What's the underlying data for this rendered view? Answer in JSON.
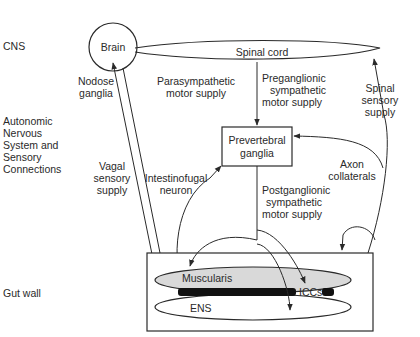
{
  "diagram": {
    "row_labels": {
      "cns": "CNS",
      "autonomic": [
        "Autonomic",
        "Nervous",
        "System and",
        "Sensory",
        "Connections"
      ],
      "gut_wall": "Gut wall"
    },
    "nodes": {
      "brain": "Brain",
      "spinal_cord": "Spinal cord",
      "prevertebral_ganglia": [
        "Prevertebral",
        "ganglia"
      ],
      "muscularis": "Muscularis",
      "ens": "ENS",
      "iccs": "ICCs"
    },
    "pathways": {
      "nodose_ganglia": [
        "Nodose",
        "ganglia"
      ],
      "parasympathetic": [
        "Parasympathetic",
        "motor supply"
      ],
      "preganglionic": [
        "Preganglionic",
        "sympathetic",
        "motor supply"
      ],
      "spinal_sensory": [
        "Spinal",
        "sensory",
        "supply"
      ],
      "vagal_sensory": [
        "Vagal",
        "sensory",
        "supply"
      ],
      "intestinofugal": [
        "Intestinofugal",
        "neuron"
      ],
      "axon_collaterals": [
        "Axon",
        "collaterals"
      ],
      "postganglionic": [
        "Postganglionic",
        "sympathetic",
        "motor supply"
      ]
    },
    "colors": {
      "line": "#2a2a2a",
      "muscularis_fill": "#d9d9d9",
      "bar": "#111111"
    }
  }
}
